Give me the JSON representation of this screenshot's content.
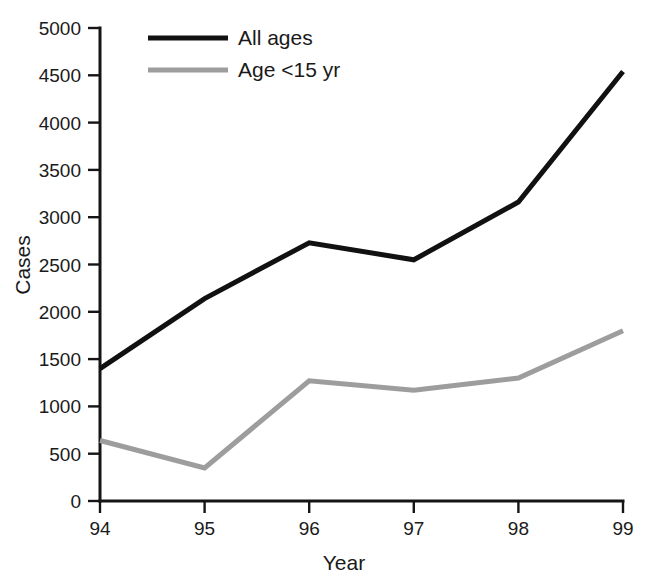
{
  "chart_data": {
    "type": "line",
    "title": "",
    "xlabel": "Year",
    "ylabel": "Cases",
    "categories": [
      "94",
      "95",
      "96",
      "97",
      "98",
      "99"
    ],
    "x": [
      94,
      95,
      96,
      97,
      98,
      99
    ],
    "xlim": [
      94,
      99
    ],
    "ylim": [
      0,
      5000
    ],
    "grid": false,
    "legend_position": "top-left-inside",
    "y_ticks": [
      "0",
      "500",
      "1000",
      "1500",
      "2000",
      "2500",
      "3000",
      "3500",
      "4000",
      "4500",
      "5000"
    ],
    "y_tick_values": [
      0,
      500,
      1000,
      1500,
      2000,
      2500,
      3000,
      3500,
      4000,
      4500,
      5000
    ],
    "x_ticks": [
      "94",
      "95",
      "96",
      "97",
      "98",
      "99"
    ],
    "series": [
      {
        "name": "All ages",
        "color": "#111111",
        "width": 5,
        "values": [
          1400,
          2140,
          2730,
          2550,
          3160,
          4540
        ]
      },
      {
        "name": "Age <15 yr",
        "color": "#9d9d9d",
        "width": 5,
        "values": [
          640,
          350,
          1270,
          1170,
          1300,
          1800
        ]
      }
    ]
  },
  "legend": {
    "entries": [
      {
        "label": "All ages",
        "color": "#111111"
      },
      {
        "label": "Age <15 yr",
        "color": "#9d9d9d"
      }
    ]
  },
  "axes": {
    "x_title": "Year",
    "y_title": "Cases"
  }
}
